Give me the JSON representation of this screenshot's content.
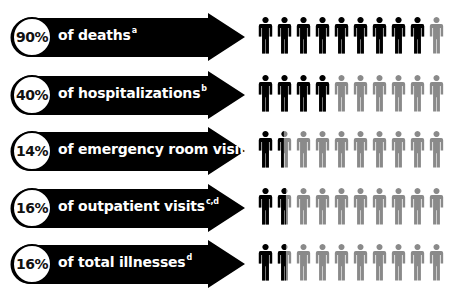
{
  "chart_data": {
    "type": "pictograph",
    "title": "",
    "unit": "10 figures = 100%",
    "categories": [
      "of deaths",
      "of hospitalizations",
      "of emergency room visits",
      "of outpatient visits",
      "of total illnesses"
    ],
    "values": [
      90,
      40,
      14,
      16,
      16
    ],
    "footnotes": [
      "a",
      "b",
      "c",
      "c,d",
      "d"
    ],
    "colors": {
      "filled": "#000000",
      "empty": "#8a8a8a"
    }
  },
  "rows": [
    {
      "pct": "90%",
      "label": "of deaths",
      "sup": "a",
      "value": 90
    },
    {
      "pct": "40%",
      "label": "of hospitalizations",
      "sup": "b",
      "value": 40
    },
    {
      "pct": "14%",
      "label": "of emergency room visits",
      "sup": "c",
      "value": 14
    },
    {
      "pct": "16%",
      "label": "of outpatient visits",
      "sup": "c,d",
      "value": 16
    },
    {
      "pct": "16%",
      "label": "of total illnesses",
      "sup": "d",
      "value": 16
    }
  ]
}
